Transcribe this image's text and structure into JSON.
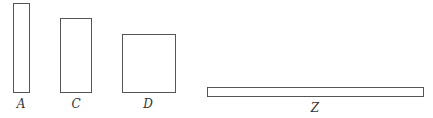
{
  "diagram": {
    "shapes": [
      {
        "id": "A",
        "label": "A",
        "type": "rectangle",
        "x": 13,
        "y": 3,
        "w": 17,
        "h": 90,
        "label_x": 21,
        "label_y": 98
      },
      {
        "id": "C",
        "label": "C",
        "type": "rectangle",
        "x": 60,
        "y": 18,
        "w": 32,
        "h": 75,
        "label_x": 76,
        "label_y": 98
      },
      {
        "id": "D",
        "label": "D",
        "type": "rectangle",
        "x": 122,
        "y": 34,
        "w": 54,
        "h": 59,
        "label_x": 148,
        "label_y": 98
      },
      {
        "id": "Z",
        "label": "Z",
        "type": "rectangle",
        "x": 207,
        "y": 87,
        "w": 217,
        "h": 10,
        "label_x": 315,
        "label_y": 102
      }
    ],
    "stroke_color": "#555555"
  }
}
